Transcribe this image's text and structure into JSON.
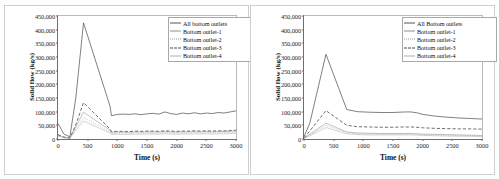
{
  "figure": {
    "panel_count": 2
  },
  "chart_data": [
    {
      "type": "line",
      "title": "Smooth\nroughness",
      "xlabel": "Time (s)",
      "ylabel": "Solid flow (kg/s)",
      "xlim": [
        0,
        3000
      ],
      "ylim": [
        0,
        450000
      ],
      "xticks": [
        0,
        500,
        1000,
        1500,
        2000,
        2500,
        3000
      ],
      "xtick_labels": [
        "0",
        "500",
        "1000",
        "1500",
        "2000",
        "2500",
        "3000"
      ],
      "yticks": [
        0,
        50000,
        100000,
        150000,
        200000,
        250000,
        300000,
        350000,
        400000,
        450000
      ],
      "ytick_labels": [
        "0",
        "50,000",
        "100,000",
        "150,000",
        "200,000",
        "250,000",
        "300,000",
        "350,000",
        "400,000",
        "450,000"
      ],
      "grid": false,
      "legend_position": "top-right",
      "x": [
        0,
        100,
        200,
        300,
        430,
        880,
        900,
        1000,
        1100,
        1200,
        1300,
        1400,
        1500,
        1600,
        1700,
        1800,
        1900,
        2000,
        2100,
        2200,
        2300,
        2400,
        2500,
        2600,
        2700,
        2800,
        2900,
        3000
      ],
      "series": [
        {
          "name": "All bottom outlets",
          "style": "solid-thick",
          "values": [
            57000,
            18000,
            8000,
            150000,
            425000,
            118000,
            85000,
            90000,
            91000,
            90000,
            92000,
            89000,
            92000,
            94000,
            91000,
            99000,
            93000,
            90000,
            95000,
            92000,
            96000,
            92000,
            95000,
            93000,
            97000,
            95000,
            99000,
            103000
          ]
        },
        {
          "name": "Bottom outlet-1",
          "style": "solid-thin",
          "values": [
            14000,
            6000,
            3000,
            45000,
            98000,
            32000,
            24000,
            25000,
            25000,
            24000,
            26000,
            25000,
            26000,
            26000,
            25000,
            27000,
            26000,
            25000,
            26000,
            26000,
            27000,
            26000,
            27000,
            26000,
            27000,
            27000,
            28000,
            29000
          ]
        },
        {
          "name": "Bottom outlet-2",
          "style": "dotted",
          "values": [
            12000,
            5000,
            2500,
            38000,
            78000,
            26000,
            20000,
            21000,
            21000,
            20000,
            22000,
            21000,
            22000,
            22000,
            21000,
            23000,
            22000,
            21000,
            22000,
            22000,
            23000,
            22000,
            23000,
            22000,
            23000,
            23000,
            24000,
            25000
          ]
        },
        {
          "name": "Bottom outlet-3",
          "style": "dashed",
          "values": [
            16000,
            7000,
            3500,
            52000,
            133000,
            36000,
            27000,
            28000,
            28000,
            27000,
            29000,
            28000,
            29000,
            29000,
            28000,
            30000,
            29000,
            28000,
            29000,
            29000,
            30000,
            29000,
            30000,
            29000,
            30000,
            30000,
            31000,
            32000
          ]
        },
        {
          "name": "Bottom outlet-4",
          "style": "solid-faint",
          "values": [
            11000,
            4500,
            2000,
            32000,
            66000,
            22000,
            16000,
            17000,
            17000,
            16000,
            18000,
            17000,
            18000,
            18000,
            17000,
            19000,
            18000,
            17000,
            18000,
            18000,
            19000,
            18000,
            19000,
            18000,
            19000,
            19000,
            20000,
            21000
          ]
        }
      ]
    },
    {
      "type": "line",
      "title": "High roughness",
      "xlabel": "Time (s)",
      "ylabel": "Solid flow (kg/s)",
      "xlim": [
        0,
        3000
      ],
      "ylim": [
        0,
        450000
      ],
      "xticks": [
        0,
        500,
        1000,
        1500,
        2000,
        2500,
        3000
      ],
      "xtick_labels": [
        "0",
        "500",
        "1000",
        "1500",
        "2000",
        "2500",
        "3000"
      ],
      "yticks": [
        0,
        50000,
        100000,
        150000,
        200000,
        250000,
        300000,
        350000,
        400000,
        450000
      ],
      "ytick_labels": [
        "0",
        "50,000",
        "100,000",
        "150,000",
        "200,000",
        "250,000",
        "300,000",
        "350,000",
        "400,000",
        "450,000"
      ],
      "grid": false,
      "legend_position": "top-right",
      "x": [
        0,
        100,
        370,
        720,
        900,
        1100,
        1300,
        1500,
        1700,
        1800,
        1900,
        2000,
        2200,
        2400,
        2600,
        2800,
        3000
      ],
      "series": [
        {
          "name": "All Bottom outlets",
          "style": "solid-thick",
          "values": [
            8000,
            60000,
            310000,
            108000,
            100000,
            98000,
            97000,
            97000,
            99000,
            99000,
            96000,
            90000,
            84000,
            80000,
            77000,
            75000,
            73000
          ]
        },
        {
          "name": "Bottom outlet-1",
          "style": "solid-thin",
          "values": [
            3000,
            18000,
            58000,
            26000,
            22000,
            21000,
            20000,
            20000,
            20000,
            20000,
            19000,
            18000,
            17000,
            16000,
            15000,
            14000,
            13000
          ]
        },
        {
          "name": "Bottom outlet-2",
          "style": "dotted",
          "values": [
            2500,
            15000,
            50000,
            23000,
            19000,
            18000,
            18000,
            18000,
            18000,
            18000,
            17000,
            16000,
            15000,
            14000,
            13000,
            12000,
            11000
          ]
        },
        {
          "name": "Bottom outlet-3",
          "style": "dashed",
          "values": [
            4000,
            30000,
            104000,
            50000,
            45000,
            44000,
            43000,
            43000,
            44000,
            44000,
            43000,
            41000,
            39000,
            38000,
            37000,
            37000,
            36000
          ]
        },
        {
          "name": "Bottom outlet-4",
          "style": "solid-faint",
          "values": [
            2000,
            12000,
            42000,
            19000,
            16000,
            15000,
            15000,
            15000,
            15000,
            15000,
            14000,
            13000,
            12000,
            11000,
            10000,
            10000,
            9000
          ]
        }
      ]
    }
  ],
  "colors": {
    "axis": "#6e6e6e",
    "text": "#111111",
    "line_all": "#555555",
    "line_1": "#8d8d8d",
    "line_2": "#9a9a9a",
    "line_3": "#4a4a4a",
    "line_4": "#b0b0b0",
    "panel_border": "#cfcfcf"
  }
}
